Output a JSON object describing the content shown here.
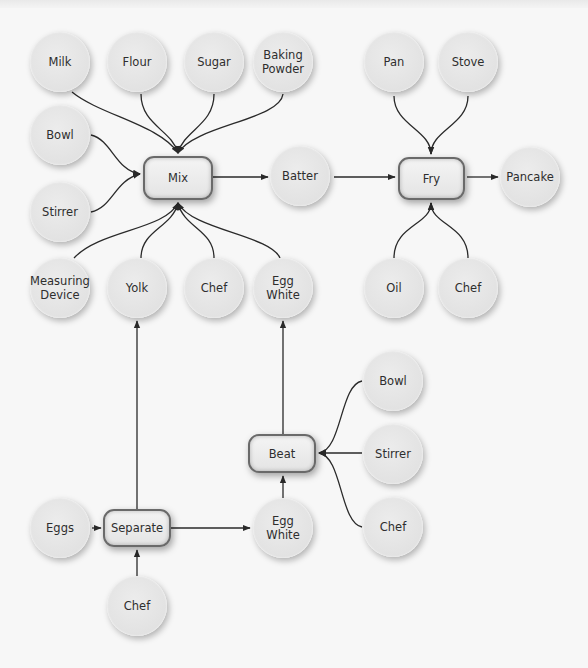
{
  "diagram": {
    "process_nodes": [
      {
        "id": "mix",
        "label": "Mix"
      },
      {
        "id": "fry",
        "label": "Fry"
      },
      {
        "id": "beat",
        "label": "Beat"
      },
      {
        "id": "separate",
        "label": "Separate"
      }
    ],
    "resource_nodes": [
      {
        "id": "milk",
        "label": "Milk"
      },
      {
        "id": "flour",
        "label": "Flour"
      },
      {
        "id": "sugar",
        "label": "Sugar"
      },
      {
        "id": "baking_powder",
        "label": "Baking\nPowder"
      },
      {
        "id": "pan",
        "label": "Pan"
      },
      {
        "id": "stove",
        "label": "Stove"
      },
      {
        "id": "bowl_mix",
        "label": "Bowl"
      },
      {
        "id": "stirrer_mix",
        "label": "Stirrer"
      },
      {
        "id": "batter",
        "label": "Batter"
      },
      {
        "id": "pancake",
        "label": "Pancake"
      },
      {
        "id": "measuring_device",
        "label": "Measuring\nDevice"
      },
      {
        "id": "yolk",
        "label": "Yolk"
      },
      {
        "id": "chef_mix",
        "label": "Chef"
      },
      {
        "id": "egg_white_mix",
        "label": "Egg\nWhite"
      },
      {
        "id": "oil",
        "label": "Oil"
      },
      {
        "id": "chef_fry",
        "label": "Chef"
      },
      {
        "id": "bowl_beat",
        "label": "Bowl"
      },
      {
        "id": "stirrer_beat",
        "label": "Stirrer"
      },
      {
        "id": "chef_beat",
        "label": "Chef"
      },
      {
        "id": "eggs",
        "label": "Eggs"
      },
      {
        "id": "egg_white_sep",
        "label": "Egg\nWhite"
      },
      {
        "id": "chef_sep",
        "label": "Chef"
      }
    ],
    "edges": [
      {
        "from": "Milk",
        "to": "Mix"
      },
      {
        "from": "Flour",
        "to": "Mix"
      },
      {
        "from": "Sugar",
        "to": "Mix"
      },
      {
        "from": "Baking Powder",
        "to": "Mix"
      },
      {
        "from": "Bowl",
        "to": "Mix"
      },
      {
        "from": "Stirrer",
        "to": "Mix"
      },
      {
        "from": "Measuring Device",
        "to": "Mix"
      },
      {
        "from": "Yolk",
        "to": "Mix"
      },
      {
        "from": "Chef",
        "to": "Mix"
      },
      {
        "from": "Egg White",
        "to": "Mix"
      },
      {
        "from": "Mix",
        "to": "Batter"
      },
      {
        "from": "Batter",
        "to": "Fry"
      },
      {
        "from": "Pan",
        "to": "Fry"
      },
      {
        "from": "Stove",
        "to": "Fry"
      },
      {
        "from": "Oil",
        "to": "Fry"
      },
      {
        "from": "Chef",
        "to": "Fry"
      },
      {
        "from": "Fry",
        "to": "Pancake"
      },
      {
        "from": "Eggs",
        "to": "Separate"
      },
      {
        "from": "Chef",
        "to": "Separate"
      },
      {
        "from": "Separate",
        "to": "Yolk"
      },
      {
        "from": "Separate",
        "to": "Egg White"
      },
      {
        "from": "Egg White",
        "to": "Beat"
      },
      {
        "from": "Bowl",
        "to": "Beat"
      },
      {
        "from": "Stirrer",
        "to": "Beat"
      },
      {
        "from": "Chef",
        "to": "Beat"
      },
      {
        "from": "Beat",
        "to": "Egg White (top)"
      }
    ]
  },
  "colors": {
    "background": "#f7f7f7",
    "node_fill": "#e4e4e4",
    "box_border": "#6a6a6a",
    "edge": "#2a2a2a",
    "text": "#2e2e2e"
  }
}
